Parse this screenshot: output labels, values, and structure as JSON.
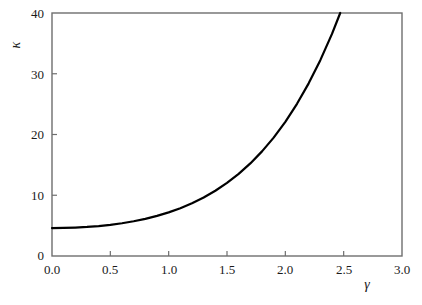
{
  "chart_data": {
    "type": "line",
    "title": "",
    "subtitle": "",
    "xlabel": "γ",
    "ylabel": "κ",
    "xlim": [
      0.0,
      3.0
    ],
    "ylim": [
      0,
      40
    ],
    "grid": false,
    "legend": null,
    "xticks": [
      "0.0",
      "0.5",
      "1.0",
      "1.5",
      "2.0",
      "2.5",
      "3.0"
    ],
    "xtick_values": [
      0.0,
      0.5,
      1.0,
      1.5,
      2.0,
      2.5,
      3.0
    ],
    "yticks": [
      "0",
      "10",
      "20",
      "30",
      "40"
    ],
    "ytick_values": [
      0,
      10,
      20,
      30,
      40
    ],
    "series": [
      {
        "name": "kappa-curve",
        "color": "#000000",
        "linewidth": 2.2,
        "x": [
          0.0,
          0.1,
          0.2,
          0.3,
          0.4,
          0.5,
          0.6,
          0.7,
          0.8,
          0.9,
          1.0,
          1.1,
          1.2,
          1.3,
          1.4,
          1.5,
          1.6,
          1.7,
          1.8,
          1.9,
          2.0,
          2.1,
          2.2,
          2.3,
          2.4,
          2.5,
          2.6,
          2.7,
          2.77
        ],
        "values": [
          4.6,
          4.62,
          4.68,
          4.78,
          4.93,
          5.13,
          5.39,
          5.72,
          6.12,
          6.6,
          7.18,
          7.87,
          8.68,
          9.63,
          10.74,
          12.03,
          13.52,
          15.24,
          17.22,
          19.49,
          22.09,
          25.05,
          28.42,
          32.24,
          36.56,
          41.44,
          46.94,
          53.13,
          57.9
        ]
      }
    ],
    "axis_color": "#6e6e6e",
    "tick_direction": "in",
    "background": "#ffffff"
  },
  "labels": {
    "y_axis_title": "κ",
    "x_axis_title": "γ"
  }
}
